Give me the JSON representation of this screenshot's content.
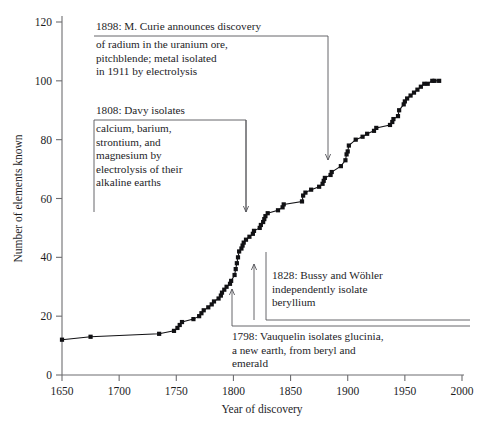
{
  "chart_data": {
    "type": "line",
    "title": "",
    "xlabel": "Year of discovery",
    "ylabel": "Number of elements known",
    "xlim": [
      1650,
      2000
    ],
    "ylim": [
      0,
      120
    ],
    "xticks": [
      1650,
      1700,
      1750,
      1800,
      1850,
      1900,
      1950,
      2000
    ],
    "yticks": [
      0,
      20,
      40,
      60,
      80,
      100,
      120
    ],
    "grid": false,
    "legend": "none",
    "marker": "square",
    "series": [
      {
        "name": "Elements known",
        "x": [
          1650,
          1675,
          1735,
          1748,
          1751,
          1753,
          1755,
          1765,
          1770,
          1772,
          1774,
          1778,
          1781,
          1783,
          1787,
          1789,
          1790,
          1792,
          1794,
          1797,
          1798,
          1801,
          1802,
          1803,
          1804,
          1805,
          1807,
          1808,
          1809,
          1811,
          1814,
          1817,
          1818,
          1823,
          1824,
          1826,
          1827,
          1828,
          1830,
          1839,
          1843,
          1844,
          1860,
          1861,
          1863,
          1868,
          1875,
          1878,
          1879,
          1880,
          1885,
          1886,
          1894,
          1898,
          1899,
          1900,
          1901,
          1907,
          1913,
          1917,
          1923,
          1925,
          1937,
          1939,
          1940,
          1944,
          1945,
          1949,
          1950,
          1952,
          1955,
          1958,
          1961,
          1964,
          1967,
          1970,
          1974,
          1976,
          1980
        ],
        "y": [
          12,
          13,
          14,
          15,
          16,
          17,
          18,
          19,
          20,
          21,
          22,
          23,
          24,
          25,
          26,
          27,
          28,
          29,
          30,
          31,
          32,
          34,
          36,
          38,
          40,
          42,
          43,
          44,
          45,
          46,
          47,
          48,
          49,
          50,
          51,
          52,
          53,
          54,
          55,
          56,
          57,
          58,
          59,
          61,
          62,
          63,
          64,
          65,
          66,
          67,
          68,
          69,
          71,
          73,
          75,
          76,
          78,
          80,
          81,
          82,
          83,
          84,
          85,
          86,
          87,
          88,
          90,
          92,
          93,
          94,
          95,
          96,
          97,
          98,
          99,
          99,
          100,
          100,
          100
        ]
      }
    ],
    "annotations": [
      {
        "id": "curie",
        "head": "1898: M. Curie announces discovery",
        "body": "of radium in the uranium ore,\npitchblende; metal isolated\nin 1911 by electrolysis",
        "points_to_x": 1905,
        "points_to_y": 80
      },
      {
        "id": "davy",
        "head": "1808: Davy isolates",
        "body": "calcium, barium,\nstrontium, and\nmagnesium by\nelectrolysis of their\nalkaline earths",
        "points_to_x": 1810,
        "points_to_y": 45
      },
      {
        "id": "bussy",
        "head": "",
        "body": "1828: Bussy and Wöhler\nindependently isolate\nberyllium",
        "points_to_x": 1828,
        "points_to_y": 54
      },
      {
        "id": "vauquelin",
        "head": "",
        "body": "1798: Vauquelin isolates glucinia,\na new earth, from beryl and\nemerald",
        "points_to_x": 1798,
        "points_to_y": 32
      }
    ]
  }
}
